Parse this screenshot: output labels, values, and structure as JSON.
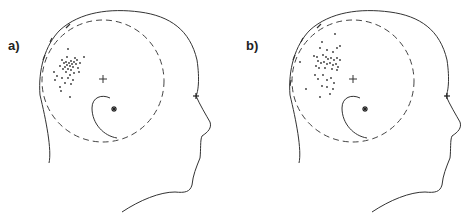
{
  "figure": {
    "panels": [
      {
        "label": "a)",
        "description": "Head profile with dashed circle, crosshair center, ear marker, nasion marker and a tight dot cluster",
        "cluster": "tight"
      },
      {
        "label": "b)",
        "description": "Head profile with dashed circle, crosshair center, ear marker, nasion marker and a more dispersed dot cluster",
        "cluster": "dispersed"
      }
    ],
    "markers": {
      "center": "crosshair",
      "ear": "asterisk",
      "nasion": "asterisk"
    },
    "colors": {
      "line": "#333333",
      "dots": "#333333",
      "background": "#ffffff"
    }
  }
}
